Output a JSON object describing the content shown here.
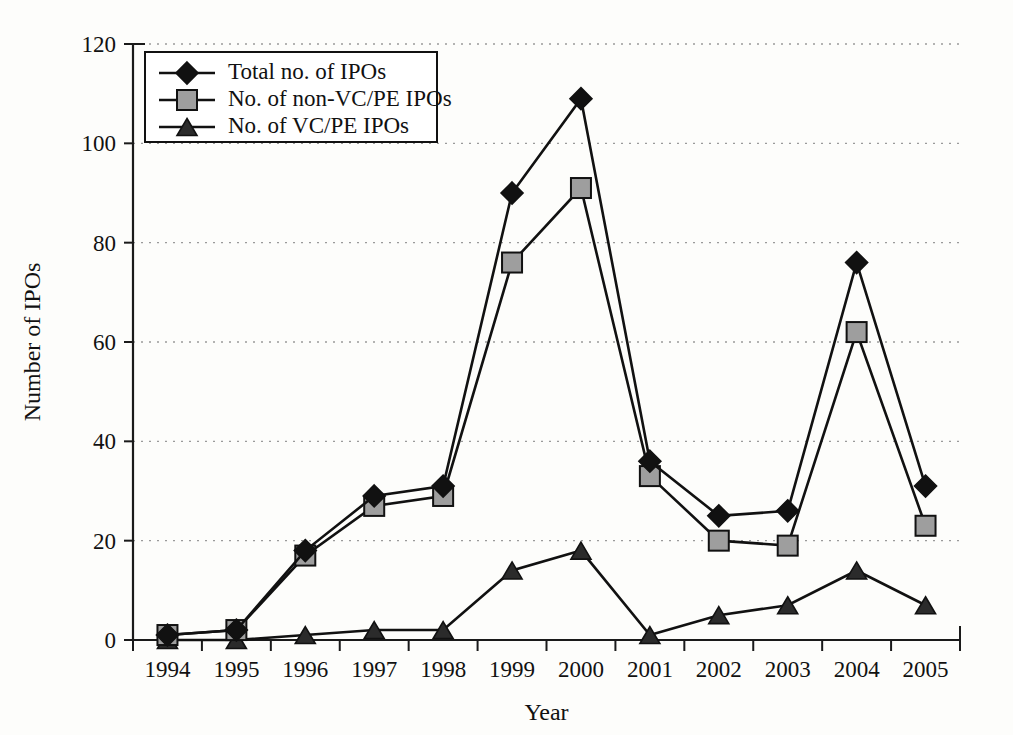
{
  "chart_data": {
    "type": "line",
    "title": "",
    "xlabel": "Year",
    "ylabel": "Number of IPOs",
    "categories": [
      "1994",
      "1995",
      "1996",
      "1997",
      "1998",
      "1999",
      "2000",
      "2001",
      "2002",
      "2003",
      "2004",
      "2005"
    ],
    "ylim": [
      0,
      120
    ],
    "ytick_step": 20,
    "yticks": [
      "0",
      "20",
      "40",
      "60",
      "80",
      "100",
      "120"
    ],
    "grid": "horizontal-dotted",
    "legend_position": "top-left-inside",
    "series": [
      {
        "name": "Total no. of IPOs",
        "marker": "diamond",
        "marker_color": "#111111",
        "line_color": "#111111",
        "values": [
          1,
          2,
          18,
          29,
          31,
          90,
          109,
          36,
          25,
          26,
          76,
          31
        ]
      },
      {
        "name": "No. of non-VC/PE IPOs",
        "marker": "square",
        "marker_color": "#9e9e9e",
        "line_color": "#111111",
        "values": [
          1,
          2,
          17,
          27,
          29,
          76,
          91,
          33,
          20,
          19,
          62,
          23
        ]
      },
      {
        "name": "No. of VC/PE IPOs",
        "marker": "triangle",
        "marker_color": "#2b2b2b",
        "line_color": "#111111",
        "values": [
          0,
          0,
          1,
          2,
          2,
          14,
          18,
          1,
          5,
          7,
          14,
          7
        ]
      }
    ]
  }
}
